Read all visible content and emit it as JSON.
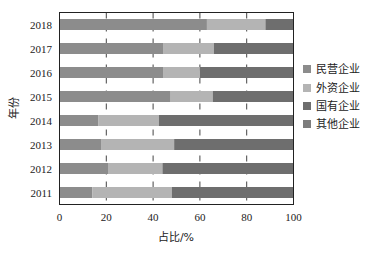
{
  "chart_data": {
    "type": "bar",
    "orientation": "horizontal",
    "stacked": true,
    "title": "",
    "xlabel": "占比/%",
    "ylabel": "年份",
    "xlim": [
      0,
      100
    ],
    "xticks": [
      0,
      20,
      40,
      60,
      80,
      100
    ],
    "grid": "vertical dashed at 20, 40, 60, 80",
    "legend_position": "right",
    "categories": [
      "2018",
      "2017",
      "2016",
      "2015",
      "2014",
      "2013",
      "2012",
      "2011"
    ],
    "series": [
      {
        "name": "民营企业",
        "color": "#8c8c8c",
        "values": [
          63,
          44.5,
          44.5,
          47.5,
          16.5,
          18,
          21,
          14
        ]
      },
      {
        "name": "外资企业",
        "color": "#b4b4b4",
        "values": [
          25,
          21.5,
          15.5,
          18,
          26,
          31,
          23,
          34
        ]
      },
      {
        "name": "国有企业",
        "color": "#6e6e6e",
        "values": [
          12,
          34,
          40,
          34.5,
          57.5,
          51,
          56,
          52
        ]
      },
      {
        "name": "其他企业",
        "color": "#7d7d7d",
        "values": [
          0,
          0,
          0,
          0,
          0,
          0,
          0,
          0
        ]
      }
    ]
  }
}
